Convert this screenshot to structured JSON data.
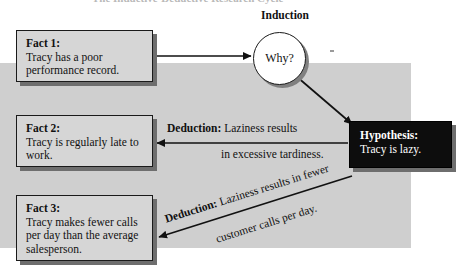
{
  "diagram": {
    "title_partial": "The Inductive-Deductive Research Cycle",
    "backdrop_color": "#cfcfcf",
    "box_fill": "#d6d6d6",
    "hypothesis_fill": "#0d0d0d",
    "border_color": "#1a1a1a",
    "shadow_color": "#6e6e6e"
  },
  "induction": {
    "label": "Induction",
    "circle_text": "Why?"
  },
  "facts": [
    {
      "id": "fact1",
      "heading": "Fact 1:",
      "body": "Tracy has a poor performance record."
    },
    {
      "id": "fact2",
      "heading": "Fact 2:",
      "body": "Tracy is regularly late to work."
    },
    {
      "id": "fact3",
      "heading": "Fact 3:",
      "body": "Tracy makes fewer calls per day than the average salesperson."
    }
  ],
  "hypothesis": {
    "heading": "Hypothesis:",
    "body": "Tracy is lazy."
  },
  "deductions": [
    {
      "id": "deduction1",
      "keyword": "Deduction:",
      "line1": " Laziness results",
      "line2": "in excessive tardiness."
    },
    {
      "id": "deduction2",
      "keyword": "Deduction:",
      "line1": " Laziness results in fewer",
      "line2": "customer calls per day."
    }
  ]
}
